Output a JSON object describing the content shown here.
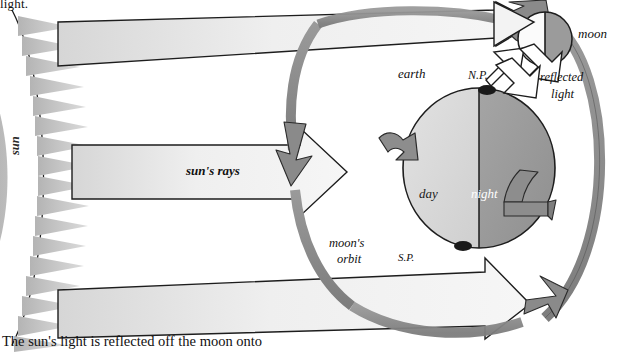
{
  "diagram": {
    "title_cropped_top": "light.",
    "caption": "The sun's light is reflected off the moon onto",
    "labels": {
      "sun": "sun",
      "suns_rays": "sun's rays",
      "earth": "earth",
      "north_pole": "N.P.",
      "south_pole": "S.P.",
      "day": "day",
      "night": "night",
      "moon": "moon",
      "reflected": "reflected",
      "light": "light",
      "moons_orbit_line1": "moon's",
      "moons_orbit_line2": "orbit"
    },
    "colors": {
      "sun_disc": "#a8a8a8",
      "sun_spikes": "#c9c9c9",
      "ray_fill": "#ececec",
      "earth_day": "#d9d9d9",
      "earth_night": "#9b9b9b",
      "moon_lit": "#fafafa",
      "moon_dark": "#9b9b9b",
      "orbit_gray": "#8e8e8e",
      "outline": "#1a1a1a",
      "background": "#ffffff"
    },
    "elements": {
      "sun_spike_count": 17,
      "ray_count": 3,
      "rotation_arrow_count": 2,
      "orbit_arrowheads": 3,
      "reflected_light_arrows": 2
    }
  }
}
